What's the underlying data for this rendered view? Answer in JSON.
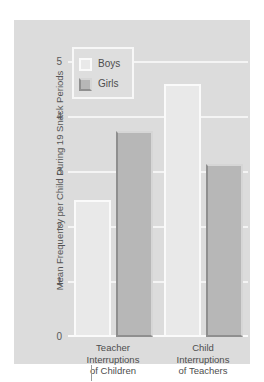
{
  "chart_data": {
    "type": "bar",
    "title": "",
    "xlabel": "",
    "ylabel": "Mean Frequency per Child During 19 Snack Periods",
    "categories": [
      "Teacher Interruptions of Children",
      "Child Interruptions of Teachers"
    ],
    "category_lines": [
      [
        "Teacher",
        "Interruptions",
        "of Children"
      ],
      [
        "Child",
        "Interruptions",
        "of Teachers"
      ]
    ],
    "series": [
      {
        "name": "Boys",
        "values": [
          2.5,
          4.6
        ],
        "color": "#e9e9e9"
      },
      {
        "name": "Girls",
        "values": [
          3.75,
          3.15
        ],
        "color": "#b7b7b7"
      }
    ],
    "ylim": [
      0,
      5
    ],
    "yticks": [
      0,
      1,
      2,
      3,
      4,
      5
    ],
    "ytick_labels": [
      "0",
      "1",
      "2",
      "3",
      "4",
      "5"
    ],
    "grid": true,
    "grid_color": "#f4f4f4",
    "legend_position": "top-left",
    "panel_color": "#dcdcdc",
    "background_color": "#ffffff",
    "text_color": "#4d4d4d"
  },
  "legend": {
    "entries": [
      {
        "label": "Boys"
      },
      {
        "label": "Girls"
      }
    ]
  }
}
